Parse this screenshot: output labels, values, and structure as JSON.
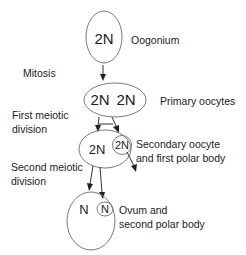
{
  "diagram": {
    "stages": {
      "oogonium": {
        "ploidy": "2N",
        "label": "Oogonium"
      },
      "primary": {
        "ploidy_left": "2N",
        "ploidy_right": "2N",
        "label": "Primary oocytes"
      },
      "secondary": {
        "ploidy_main": "2N",
        "ploidy_polar": "2N",
        "label_line1": "Secondary oocyte",
        "label_line2": "and first polar body"
      },
      "ovum": {
        "ploidy_main": "N",
        "ploidy_polar": "N",
        "label_line1": "Ovum and",
        "label_line2": "second polar body"
      }
    },
    "processes": {
      "mitosis": "Mitosis",
      "first_meiotic_line1": "First meiotic",
      "first_meiotic_line2": "division",
      "second_meiotic_line1": "Second meiotic",
      "second_meiotic_line2": "division"
    },
    "colors": {
      "cell_outline": "#7a7a7a",
      "arrow": "#222222",
      "text": "#222222"
    }
  }
}
